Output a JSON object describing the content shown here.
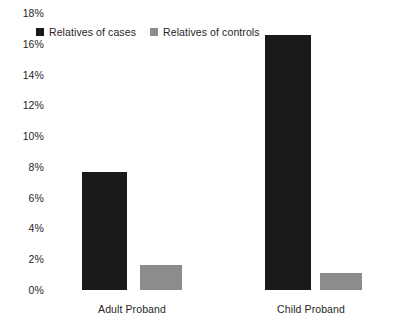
{
  "chart_data": {
    "type": "bar",
    "title": "",
    "subtitle": "",
    "xlabel": "",
    "ylabel": "",
    "categories": [
      "Adult Proband",
      "Child Proband"
    ],
    "series": [
      {
        "name": "Relatives of cases",
        "color": "#1a1a1a",
        "values": [
          7.7,
          16.6
        ]
      },
      {
        "name": "Relatives of controls",
        "color": "#8c8c8c",
        "values": [
          1.6,
          1.1
        ]
      }
    ],
    "ylim": [
      0,
      18
    ],
    "ytick_values": [
      18,
      16,
      14,
      12,
      10,
      8,
      6,
      4,
      2,
      0
    ],
    "ytick_labels": [
      "18%",
      "16%",
      "14%",
      "12%",
      "10%",
      "8%",
      "6%",
      "4%",
      "2%",
      "0%"
    ],
    "grid": false,
    "legend_position": "top-left",
    "value_suffix": "%"
  },
  "legend": {
    "entries": [
      {
        "label": "Relatives of cases",
        "swatch": "dark-square-swatch"
      },
      {
        "label": "Relatives of controls",
        "swatch": "gray-square-swatch"
      }
    ]
  }
}
